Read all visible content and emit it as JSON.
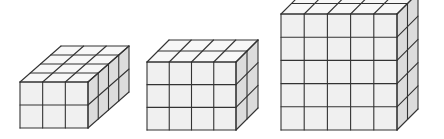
{
  "figure": {
    "colors": {
      "front": "#f0f0f0",
      "top": "#f7f7f7",
      "side": "#dcdcdc",
      "edge": "#333333",
      "background": "#ffffff"
    },
    "prisms": [
      {
        "name": "prism-3x2x4",
        "width_cubes": 3,
        "height_cubes": 2,
        "depth_cubes": 4,
        "front_x": 20,
        "front_y": 82,
        "front_w": 68,
        "front_h": 46,
        "depth_dx": 41,
        "depth_dy": -36
      },
      {
        "name": "prism-4x3x2",
        "width_cubes": 4,
        "height_cubes": 3,
        "depth_cubes": 2,
        "front_x": 147,
        "front_y": 62,
        "front_w": 89,
        "front_h": 68,
        "depth_dx": 22,
        "depth_dy": -22
      },
      {
        "name": "prism-5x5x2",
        "width_cubes": 5,
        "height_cubes": 5,
        "depth_cubes": 2,
        "front_x": 281,
        "front_y": 14,
        "front_w": 116,
        "front_h": 116,
        "depth_dx": 21,
        "depth_dy": -21
      }
    ]
  }
}
